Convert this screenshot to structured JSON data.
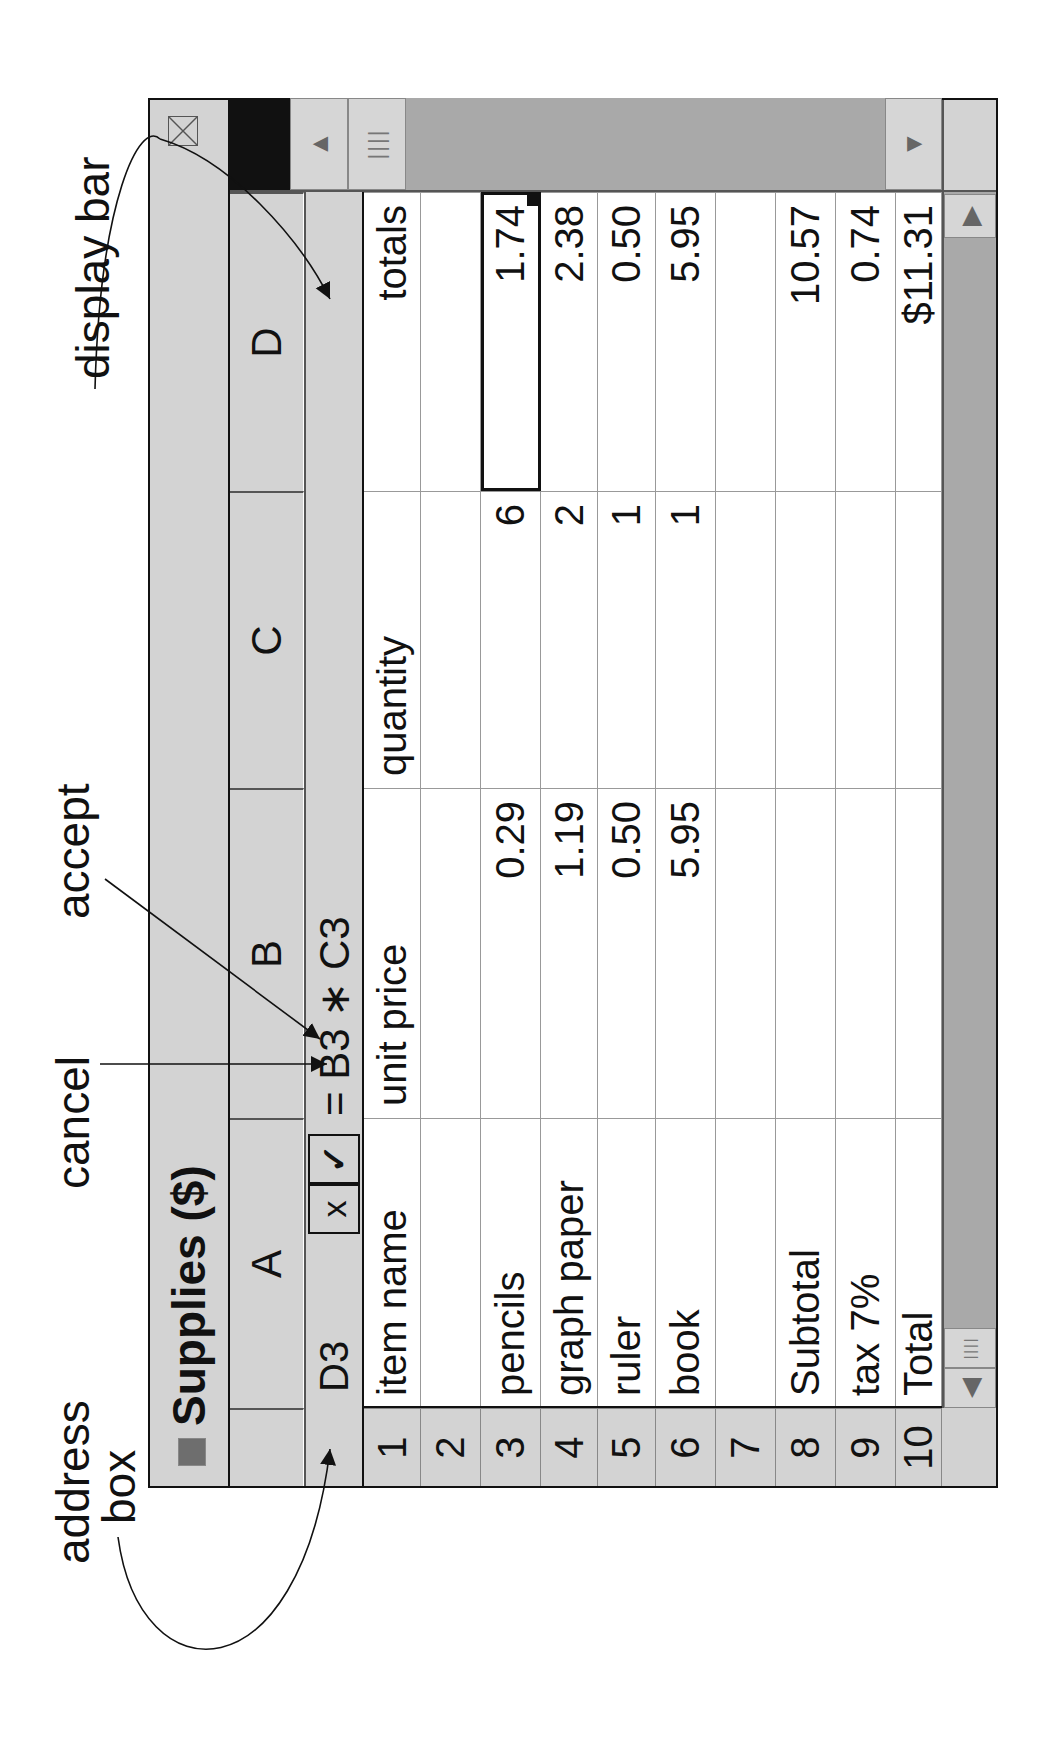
{
  "window": {
    "title": "Supplies ($)",
    "columns": [
      "A",
      "B",
      "C",
      "D"
    ],
    "address_box": "D3",
    "cancel_label": "x",
    "accept_label": "✓",
    "formula": "= B3 ∗ C3",
    "selected_cell": "D3"
  },
  "grid": {
    "row_numbers": [
      "1",
      "2",
      "3",
      "4",
      "5",
      "6",
      "7",
      "8",
      "9",
      "10"
    ],
    "rows": [
      {
        "A": "item name",
        "B": "unit price",
        "C": "quantity",
        "D": "totals"
      },
      {
        "A": "",
        "B": "",
        "C": "",
        "D": ""
      },
      {
        "A": "pencils",
        "B": "0.29",
        "C": "6",
        "D": "1.74"
      },
      {
        "A": "graph paper",
        "B": "1.19",
        "C": "2",
        "D": "2.38"
      },
      {
        "A": "ruler",
        "B": "0.50",
        "C": "1",
        "D": "0.50"
      },
      {
        "A": "book",
        "B": "5.95",
        "C": "1",
        "D": "5.95"
      },
      {
        "A": "",
        "B": "",
        "C": "",
        "D": ""
      },
      {
        "A": "Subtotal",
        "B": "",
        "C": "",
        "D": "10.57"
      },
      {
        "A": "tax   7%",
        "B": "",
        "C": "",
        "D": "0.74"
      },
      {
        "A": "Total",
        "B": "",
        "C": "",
        "D": "$11.31"
      }
    ]
  },
  "annotations": {
    "address_box": "address\nbox",
    "address_line1": "address",
    "address_line2": "box",
    "cancel": "cancel",
    "accept": "accept",
    "display_bar": "display bar"
  },
  "icons": {
    "close": "close-box-icon",
    "scroll_left": "◀",
    "scroll_right": "▶",
    "scroll_up": "▲",
    "scroll_down": "▼",
    "thumb": "||||"
  },
  "colors": {
    "chrome": "#d3d3d3",
    "scroll_track": "#a9a9a9",
    "ink": "#111111"
  }
}
